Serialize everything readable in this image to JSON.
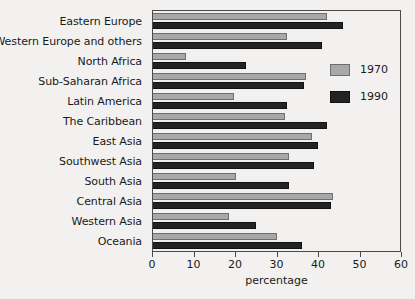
{
  "chart_data": {
    "type": "bar",
    "orientation": "horizontal",
    "title": "",
    "xlabel": "percentage",
    "ylabel": "",
    "xlim": [
      0,
      60
    ],
    "xticks": [
      0,
      10,
      20,
      30,
      40,
      50,
      60
    ],
    "xtick_labels": [
      "0",
      "10",
      "20",
      "30",
      "40",
      "50",
      "60"
    ],
    "grid": false,
    "legend_position": "right",
    "categories": [
      "Eastern Europe",
      "Western Europe and others",
      "North Africa",
      "Sub-Saharan Africa",
      "Latin America",
      "The Caribbean",
      "East Asia",
      "Southwest Asia",
      "South Asia",
      "Central Asia",
      "Western Asia",
      "Oceania"
    ],
    "series": [
      {
        "name": "1970",
        "color": "#a8a8a8",
        "values": [
          42,
          32.5,
          8,
          37,
          19.5,
          32,
          38.5,
          33,
          20,
          43.5,
          18.5,
          30
        ]
      },
      {
        "name": "1990",
        "color": "#232323",
        "values": [
          46,
          41,
          22.5,
          36.5,
          32.5,
          42,
          40,
          39,
          33,
          43,
          25,
          36
        ]
      }
    ]
  },
  "legend": {
    "items": [
      {
        "label": "1970"
      },
      {
        "label": "1990"
      }
    ]
  }
}
